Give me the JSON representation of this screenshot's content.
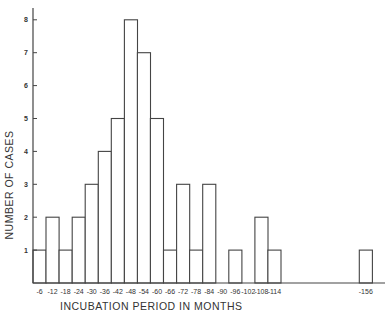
{
  "chart_data": {
    "type": "bar",
    "title": "",
    "xlabel": "INCUBATION PERIOD IN MONTHS",
    "ylabel": "NUMBER OF CASES",
    "bin_width_months": 6,
    "categories": [
      "0-6",
      "6-12",
      "12-18",
      "18-24",
      "24-30",
      "30-36",
      "36-42",
      "42-48",
      "48-54",
      "54-60",
      "60-66",
      "66-72",
      "72-78",
      "78-84",
      "84-90",
      "90-96",
      "96-102",
      "102-108",
      "108-114",
      "114-120",
      "120-126",
      "126-132",
      "132-138",
      "138-144",
      "144-150",
      "150-156"
    ],
    "values": [
      1,
      2,
      1,
      2,
      3,
      4,
      5,
      8,
      7,
      5,
      1,
      3,
      1,
      3,
      0,
      1,
      0,
      2,
      1,
      0,
      0,
      0,
      0,
      0,
      0,
      1
    ],
    "x_tick_labels": [
      "-6",
      "-12",
      "-18",
      "-24",
      "-30",
      "-36",
      "-42",
      "-48",
      "-54",
      "-60",
      "-66",
      "-72",
      "-78",
      "-84",
      "-90",
      "-96",
      "-102",
      "-108",
      "-114",
      "-156"
    ],
    "y_ticks": [
      1,
      2,
      3,
      4,
      5,
      6,
      7,
      8
    ],
    "ylim": [
      0,
      8.4
    ],
    "grid": false,
    "legend": null
  },
  "colors": {
    "line": "#444444",
    "fill": "#ffffff",
    "text": "#333333"
  }
}
